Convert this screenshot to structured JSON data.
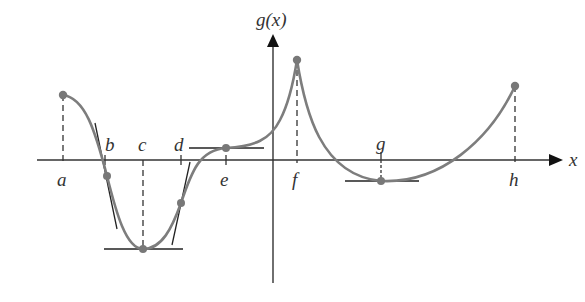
{
  "diagram": {
    "y_axis_label": "g(x)",
    "x_axis_label": "x",
    "curve_color": "#7a7a7a",
    "point_color": "#777777",
    "axis_color": "#333333",
    "points": [
      {
        "label": "a",
        "description": "left endpoint, local max"
      },
      {
        "label": "b",
        "description": "inflection point with tangent line"
      },
      {
        "label": "c",
        "description": "local minimum with horizontal tangent"
      },
      {
        "label": "d",
        "description": "inflection point with tangent line"
      },
      {
        "label": "e",
        "description": "horizontal tangent (inflection)"
      },
      {
        "label": "f",
        "description": "cusp, local max"
      },
      {
        "label": "g",
        "description": "local minimum with horizontal tangent"
      },
      {
        "label": "h",
        "description": "right endpoint"
      }
    ]
  }
}
